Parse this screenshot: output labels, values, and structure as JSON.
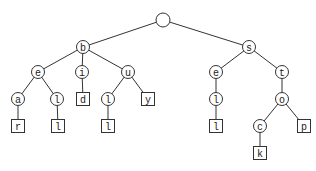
{
  "diagram": {
    "type": "trie",
    "words": [
      "bear",
      "bell",
      "bid",
      "bull",
      "buy",
      "sell",
      "stock",
      "stop"
    ],
    "colors": {
      "stroke": "#333333",
      "fill": "#ffffff",
      "text": "#222222"
    },
    "nodes": [
      {
        "id": "root",
        "label": "",
        "shape": "circle",
        "x": 163,
        "y": 20,
        "r": 7
      },
      {
        "id": "b",
        "label": "b",
        "shape": "circle",
        "x": 83,
        "y": 47,
        "parent": "root"
      },
      {
        "id": "s",
        "label": "s",
        "shape": "circle",
        "x": 249,
        "y": 47,
        "parent": "root"
      },
      {
        "id": "be",
        "label": "e",
        "shape": "circle",
        "x": 38,
        "y": 72,
        "parent": "b"
      },
      {
        "id": "bi",
        "label": "i",
        "shape": "circle",
        "x": 82,
        "y": 72,
        "parent": "b"
      },
      {
        "id": "bu",
        "label": "u",
        "shape": "circle",
        "x": 128,
        "y": 72,
        "parent": "b"
      },
      {
        "id": "se",
        "label": "e",
        "shape": "circle",
        "x": 216,
        "y": 72,
        "parent": "s"
      },
      {
        "id": "st",
        "label": "t",
        "shape": "circle",
        "x": 282,
        "y": 72,
        "parent": "s"
      },
      {
        "id": "bea",
        "label": "a",
        "shape": "circle",
        "x": 18,
        "y": 99,
        "parent": "be"
      },
      {
        "id": "bel",
        "label": "l",
        "shape": "circle",
        "x": 57,
        "y": 99,
        "parent": "be"
      },
      {
        "id": "bid",
        "label": "d",
        "shape": "square",
        "x": 83,
        "y": 99,
        "parent": "bi"
      },
      {
        "id": "bul",
        "label": "l",
        "shape": "circle",
        "x": 108,
        "y": 99,
        "parent": "bu"
      },
      {
        "id": "buy",
        "label": "y",
        "shape": "square",
        "x": 148,
        "y": 99,
        "parent": "bu"
      },
      {
        "id": "sel",
        "label": "l",
        "shape": "circle",
        "x": 216,
        "y": 99,
        "parent": "se"
      },
      {
        "id": "sto",
        "label": "o",
        "shape": "circle",
        "x": 282,
        "y": 99,
        "parent": "st"
      },
      {
        "id": "bear",
        "label": "r",
        "shape": "square",
        "x": 18,
        "y": 126,
        "parent": "bea"
      },
      {
        "id": "bell",
        "label": "l",
        "shape": "square",
        "x": 58,
        "y": 126,
        "parent": "bel"
      },
      {
        "id": "bull",
        "label": "l",
        "shape": "square",
        "x": 108,
        "y": 126,
        "parent": "bul"
      },
      {
        "id": "sell",
        "label": "l",
        "shape": "square",
        "x": 216,
        "y": 126,
        "parent": "sel"
      },
      {
        "id": "stoc",
        "label": "c",
        "shape": "circle",
        "x": 260,
        "y": 126,
        "parent": "sto"
      },
      {
        "id": "stop",
        "label": "p",
        "shape": "square",
        "x": 304,
        "y": 126,
        "parent": "sto"
      },
      {
        "id": "stock",
        "label": "k",
        "shape": "square",
        "x": 260,
        "y": 153,
        "parent": "stoc"
      }
    ]
  }
}
